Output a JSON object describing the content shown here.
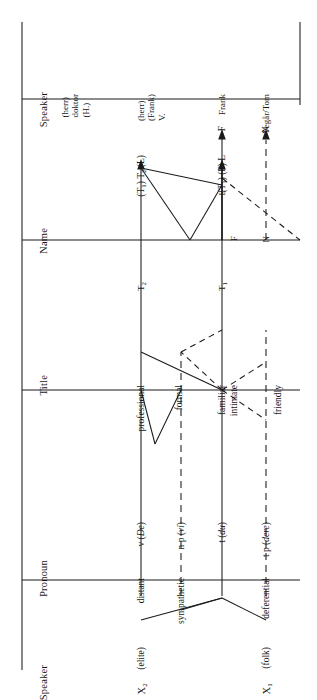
{
  "figure": {
    "orientation": "rotated-90-ccw",
    "background": "#ffffff",
    "line_color": "#1a1a1a"
  },
  "columns": [
    {
      "key": "speaker",
      "label": "Speaker"
    },
    {
      "key": "pronoun",
      "label": "Pronoun"
    },
    {
      "key": "title",
      "label": "Title"
    },
    {
      "key": "name",
      "label": "Name"
    },
    {
      "key": "examples",
      "label": "Examples"
    }
  ],
  "tracks": [
    {
      "id": "t2",
      "style": "solid",
      "speaker_node": "X",
      "speaker_sub": "2",
      "speaker_paren": "(elite)",
      "pronoun_relation": "distant",
      "pronoun_form": "v (De)",
      "pronoun_form_plain": "v (",
      "pronoun_form_italic": "De",
      "pronoun_form_tail": ")",
      "title_relation": "professional",
      "name_node": "T",
      "name_node_sub": "2",
      "name_terminal": "(T₁) T₂ (L)",
      "examples": "(herr)\ndoktor\n(H.)"
    },
    {
      "id": "np",
      "style": "dashed",
      "speaker_node": "",
      "speaker_paren": "",
      "pronoun_relation": "sympathetic",
      "pronoun_form_plain": "n p (",
      "pronoun_form_italic": "vi",
      "pronoun_form_tail": ")",
      "title_relation": "",
      "name_node": "",
      "name_terminal": "",
      "examples": ""
    },
    {
      "id": "t1",
      "style": "solid",
      "speaker_node": "X",
      "speaker_sub": "1",
      "speaker_paren": "(folk)",
      "pronoun_relation": "",
      "pronoun_form_plain": "t (",
      "pronoun_form_italic": "du",
      "pronoun_form_tail": ")",
      "title_relation": "formal",
      "name_node": "T",
      "name_node_sub": "1",
      "name_terminal": "(T₁) (F) L",
      "examples": "(herr)\n(Frank)\nV."
    },
    {
      "id": "tp",
      "style": "dashed",
      "speaker_node": "",
      "speaker_paren": "",
      "pronoun_relation": "deferential",
      "pronoun_form_plain": "t p (",
      "pronoun_form_italic": "dere",
      "pronoun_form_tail": ")",
      "title_relation": "",
      "name_node": "",
      "name_terminal": "",
      "examples": ""
    }
  ],
  "title_labels": [
    "professional",
    "formal",
    "familiar",
    "intimate",
    "friendly"
  ],
  "name_labels": {
    "t2_node": "T₂",
    "t1_node": "T₁",
    "l_node": "L",
    "f_node": "F",
    "n_node": "N"
  },
  "terminals": [
    {
      "label": "(T₁) T₂ (L)",
      "example": "(herr)\ndoktor\n(H.)",
      "style": "solid"
    },
    {
      "label": "(T₁) (F) L",
      "example": "(herr)\n(Frank)\nV.",
      "style": "solid"
    },
    {
      "label": "F",
      "example": "Frank",
      "style": "solid"
    },
    {
      "label": "N",
      "example": "Vegår/Tom",
      "style": "dashed"
    }
  ],
  "arrow_tip_labels": [
    "(T₁) T₂ (L)",
    "(T₁) (F) L",
    "F",
    "N"
  ],
  "examples_text": [
    "(herr) doktor (H.)",
    "(herr) (Frank) V.",
    "Frank",
    "Vegår/Tom"
  ]
}
